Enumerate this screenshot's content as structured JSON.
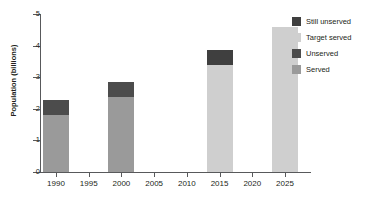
{
  "chart_data": {
    "type": "bar",
    "stacked": true,
    "title": "",
    "subtitle": "",
    "xlabel": "",
    "ylabel": "Population (billions)",
    "ylim": [
      0,
      5
    ],
    "yticks": [
      0,
      1,
      2,
      3,
      4,
      5
    ],
    "ytick_labels": [
      "0",
      "1",
      "2",
      "3",
      "4",
      "5"
    ],
    "xticks": [
      1990,
      1995,
      2000,
      2005,
      2010,
      2015,
      2020,
      2025
    ],
    "xtick_labels": [
      "1990",
      "1995",
      "2000",
      "2005",
      "2010",
      "2015",
      "2020",
      "2025"
    ],
    "categories": [
      "1990",
      "1995",
      "2000",
      "2005",
      "2010",
      "2015",
      "2020",
      "2025"
    ],
    "grid": false,
    "legend_position": "right",
    "series": [
      {
        "name": "Served",
        "color": "#9a9a9a",
        "values": [
          1.8,
          null,
          2.37,
          null,
          null,
          null,
          null,
          null
        ]
      },
      {
        "name": "Unserved",
        "color": "#4c4c4c",
        "values": [
          0.47,
          null,
          0.47,
          null,
          null,
          null,
          null,
          null
        ]
      },
      {
        "name": "Target served",
        "color": "#cfcfcf",
        "values": [
          null,
          null,
          null,
          null,
          null,
          3.38,
          null,
          4.6
        ]
      },
      {
        "name": "Still unserved",
        "color": "#3f3f3f",
        "values": [
          null,
          null,
          null,
          null,
          null,
          0.47,
          null,
          0.0
        ]
      }
    ],
    "bar_totals": [
      2.27,
      null,
      2.84,
      null,
      null,
      3.85,
      null,
      4.6
    ],
    "bars": [
      {
        "category": "1990",
        "total": 2.27,
        "segments": [
          {
            "name": "Served",
            "value": 1.8,
            "color": "#9a9a9a"
          },
          {
            "name": "Unserved",
            "value": 0.47,
            "color": "#4c4c4c"
          }
        ]
      },
      {
        "category": "2000",
        "total": 2.84,
        "segments": [
          {
            "name": "Served",
            "value": 2.37,
            "color": "#9a9a9a"
          },
          {
            "name": "Unserved",
            "value": 0.47,
            "color": "#4c4c4c"
          }
        ]
      },
      {
        "category": "2015",
        "total": 3.85,
        "segments": [
          {
            "name": "Target served",
            "value": 3.38,
            "color": "#cfcfcf"
          },
          {
            "name": "Still unserved",
            "value": 0.47,
            "color": "#3f3f3f"
          }
        ]
      },
      {
        "category": "2025",
        "total": 4.6,
        "segments": [
          {
            "name": "Target served",
            "value": 4.6,
            "color": "#cfcfcf"
          }
        ]
      }
    ],
    "legend": [
      {
        "label": "Still unserved",
        "color": "#3f3f3f"
      },
      {
        "label": "Target served",
        "color": "#cfcfcf"
      },
      {
        "label": "Unserved",
        "color": "#4c4c4c"
      },
      {
        "label": "Served",
        "color": "#9a9a9a"
      }
    ]
  },
  "axis_color": "#58595b",
  "text_color": "#231f20",
  "background": "#ffffff"
}
